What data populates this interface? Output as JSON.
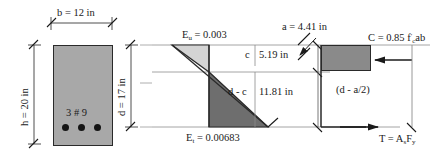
{
  "figure": {
    "colors": {
      "section_fill": "#a8a8a8",
      "compression_triangle": "#d4d4d4",
      "tension_triangle": "#6e6e6e",
      "stress_block": "#8a8a8a",
      "line": "#2a2a2a",
      "thin_line": "#8c8c8c",
      "rebar": "#141414"
    }
  },
  "cross_section": {
    "width_label": "b = 12 in",
    "height_label": "h = 20 in",
    "depth_label": "d = 17 in",
    "rebar_label": "3 # 9",
    "rebar_count": 3
  },
  "strain_diagram": {
    "top_strain_symbol": "E",
    "top_strain_subscript": "u",
    "top_strain_value": "= 0.003",
    "top_strain_full": "εu = 0.003",
    "bottom_strain_symbol": "E",
    "bottom_strain_subscript": "t",
    "bottom_strain_value": "= 0.00683",
    "bottom_strain_full": "εt = 0.00683",
    "c_label": "c",
    "c_value": "5.19 in",
    "dc_label": "d - c",
    "dc_value": "11.81 in"
  },
  "stress_diagram": {
    "a_label": "a = 4.41 in",
    "compression_force_prefix": "C = 0.85 f",
    "compression_force_sub": "c",
    "compression_force_suffix": "ab",
    "compression_force_full": "C = 0.85 f'c ab",
    "moment_arm": "(d - a/2)",
    "tension_force_prefix": "T = A",
    "tension_force_sub1": "s",
    "tension_force_mid": "F",
    "tension_force_sub2": "y",
    "tension_force_full": "T = As Fy"
  }
}
